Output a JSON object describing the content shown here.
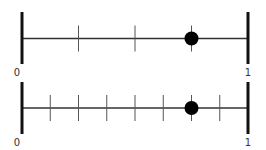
{
  "diagram": {
    "type": "number-lines",
    "colors": {
      "line": "#333333",
      "endpoint": "#111111",
      "tick": "#555555",
      "dot": "#000000",
      "label": "#333333"
    },
    "lines": [
      {
        "name": "fourths-number-line",
        "start_label": "0",
        "end_label": "1",
        "divisions": 4,
        "point_value": "3/4"
      },
      {
        "name": "eighths-number-line",
        "start_label": "0",
        "end_label": "1",
        "divisions": 8,
        "point_value": "6/8"
      }
    ]
  }
}
